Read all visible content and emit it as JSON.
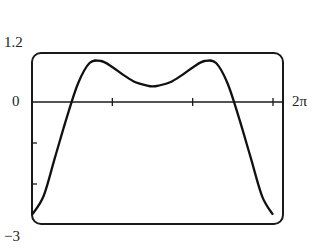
{
  "chart_data": {
    "type": "line",
    "title": "",
    "xlabel": "",
    "ylabel": "",
    "xlim": [
      0,
      6.2832
    ],
    "ylim": [
      -3,
      1.2
    ],
    "x_tick_labels": [
      "2π"
    ],
    "y_tick_labels": [
      "1.2",
      "0",
      "-3"
    ],
    "x_ticks": [
      2.0944,
      4.1888,
      6.2832
    ],
    "y_ticks": [
      -1,
      -2
    ],
    "grid": false,
    "legend": null,
    "series": [
      {
        "name": "f(x)",
        "x": [
          0,
          0.3,
          0.6,
          0.9,
          1.2,
          1.5,
          1.8,
          2.1,
          2.4,
          2.7,
          3.0,
          3.1416,
          3.3,
          3.6,
          3.9,
          4.2,
          4.5,
          4.8,
          5.1,
          5.4,
          5.7,
          6.0,
          6.2832
        ],
        "y": [
          -2.75,
          -2.3,
          -1.35,
          -0.4,
          0.45,
          0.95,
          1.0,
          0.85,
          0.65,
          0.48,
          0.4,
          0.38,
          0.4,
          0.48,
          0.65,
          0.85,
          1.0,
          0.95,
          0.45,
          -0.4,
          -1.35,
          -2.3,
          -2.75
        ]
      }
    ]
  },
  "labels": {
    "ymax": "1.2",
    "yzero": "0",
    "ymin": "−3",
    "xmax": "2π"
  }
}
